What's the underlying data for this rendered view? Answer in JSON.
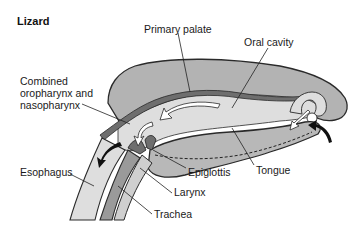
{
  "title": "Lizard",
  "labels": {
    "primary_palate": "Primary palate",
    "oral_cavity": "Oral cavity",
    "combined_line1": "Combined",
    "combined_line2": "oropharynx and",
    "combined_line3": "nasopharynx",
    "esophagus": "Esophagus",
    "epiglottis": "Epiglottis",
    "tongue": "Tongue",
    "larynx": "Larynx",
    "trachea": "Trachea"
  },
  "colors": {
    "head_fill": "#b3b3b3",
    "cavity_fill": "#dedede",
    "palate_fill": "#6e6e6e",
    "tongue_fill": "#b8b8b8",
    "outline": "#2a2a2a",
    "arrow_light": "#ffffff",
    "arrow_dark": "#111111"
  }
}
